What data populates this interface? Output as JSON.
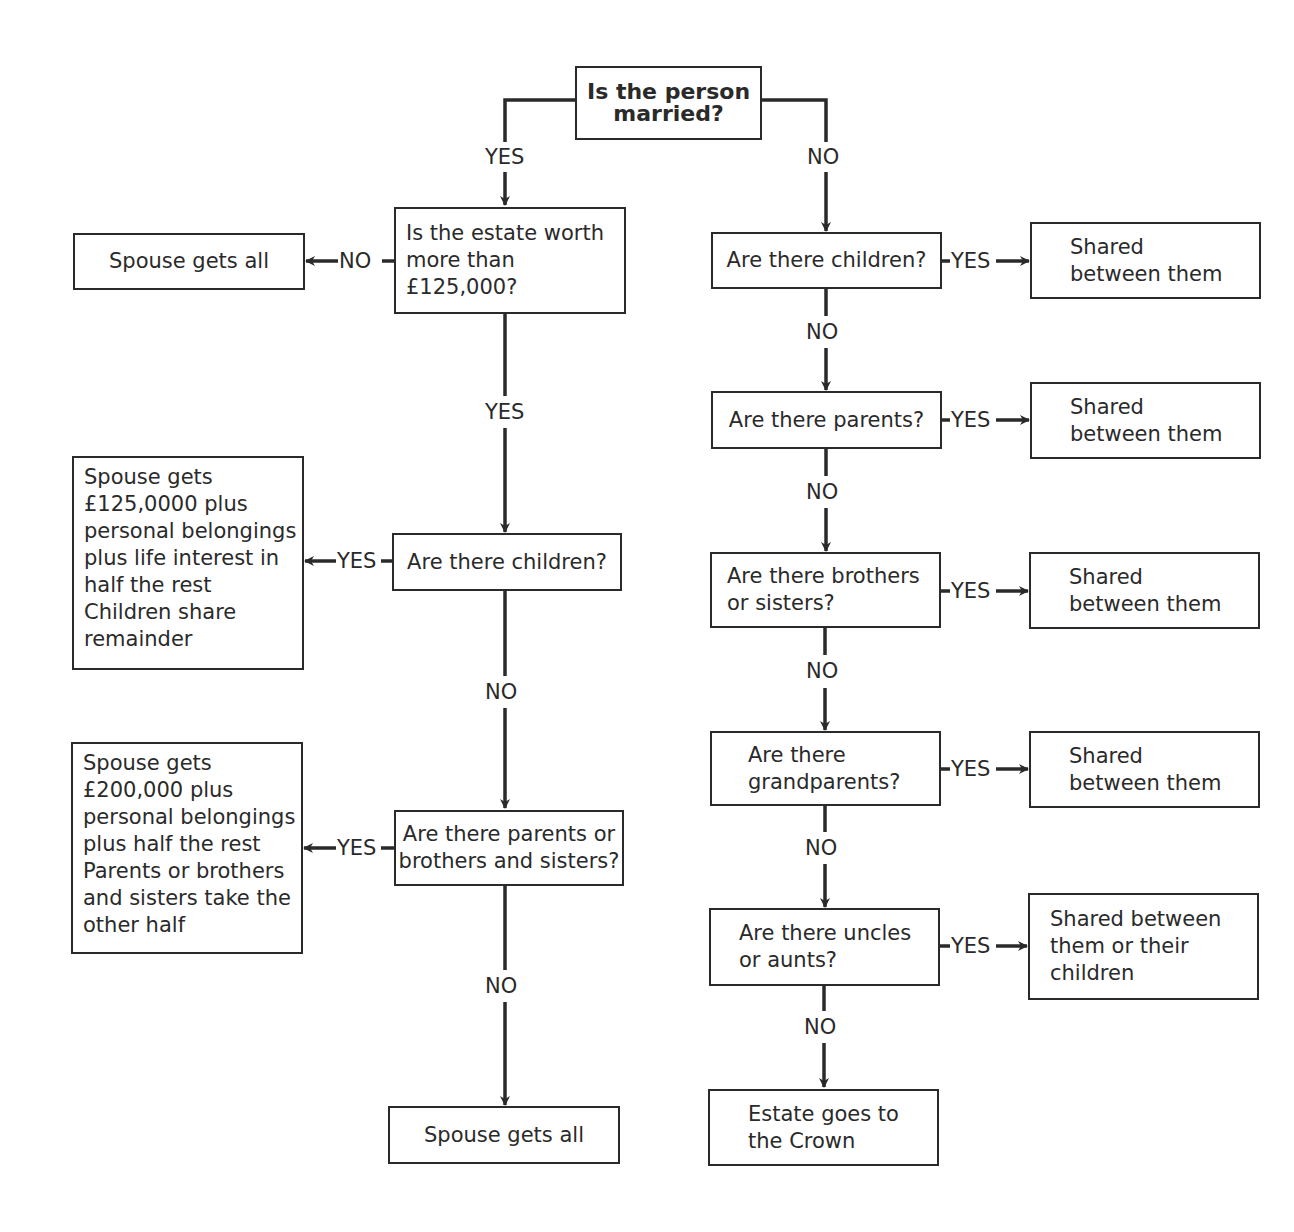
{
  "diagram": {
    "title": "Is the person married?",
    "labels": {
      "yes": "YES",
      "no": "NO"
    },
    "married_branch": {
      "q_estate": "Is the estate worth\nmore than\n£125,000?",
      "r_spouse_all_1": "Spouse gets all",
      "q_children": "Are there children?",
      "r_children": "Spouse gets\n£125,0000 plus\npersonal belongings\nplus life interest in\nhalf the rest\nChildren share\nremainder",
      "q_parents_siblings": "Are there parents or\nbrothers and sisters?",
      "r_parents_siblings": "Spouse gets\n£200,000 plus\npersonal belongings\nplus half the rest\nParents or brothers\nand sisters take the\nother half",
      "r_spouse_all_2": "Spouse gets all"
    },
    "unmarried_branch": {
      "q_children": "Are there children?",
      "q_parents": "Are there parents?",
      "q_siblings": "Are there brothers\nor sisters?",
      "q_grandparents": "Are there\ngrandparents?",
      "q_uncles_aunts": "Are there uncles\nor aunts?",
      "r_shared": "Shared\nbetween them",
      "r_shared_uncles": "Shared between\nthem or their\nchildren",
      "r_crown": "Estate goes to\nthe Crown"
    }
  },
  "colors": {
    "stroke": "#2a2a2a",
    "background": "#ffffff"
  }
}
